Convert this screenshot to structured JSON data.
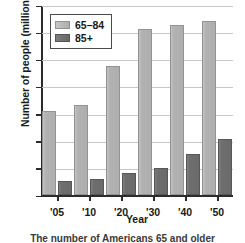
{
  "chart_data": {
    "type": "bar",
    "title": "",
    "caption": "The number of Americans 65 and older",
    "xlabel": "Year",
    "ylabel": "Number of people (millions)",
    "categories": [
      "'05",
      "'10",
      "'20",
      "'30",
      "'40",
      "'50"
    ],
    "series": [
      {
        "name": "65–84",
        "color": "#b0b0b0",
        "values": [
          31,
          33,
          47.5,
          61,
          62.5,
          64
        ]
      },
      {
        "name": "85+",
        "color": "#6e6e6e",
        "values": [
          5,
          6,
          8,
          10,
          15,
          20.5
        ]
      }
    ],
    "ylim": [
      0,
      70
    ],
    "ytick_values": [
      0,
      10,
      20,
      30,
      40,
      50,
      60,
      70
    ],
    "ytick_labels": [
      "0",
      "10",
      "20",
      "30",
      "40",
      "50",
      "60",
      "70"
    ],
    "grid": true,
    "grid_axis": "y",
    "legend_position": "upper-left",
    "legend_entries": [
      "65–84",
      "85+"
    ]
  }
}
